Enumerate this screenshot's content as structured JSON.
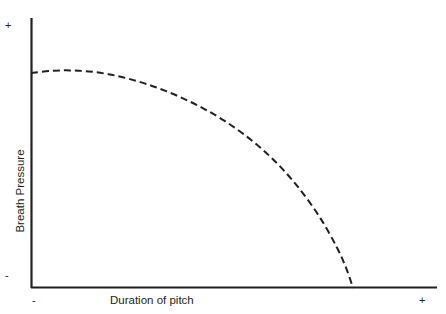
{
  "figure": {
    "background_color": "#ffffff",
    "ink_color": "#231f20",
    "width": 446,
    "height": 314
  },
  "axes": {
    "x": {
      "title": "Duration of pitch",
      "low_tick_label": "-",
      "high_tick_label": "+",
      "line_color": "#231f20",
      "origin_px": 31,
      "end_px": 437,
      "baseline_px": 288
    },
    "y": {
      "title": "Breath Pressure",
      "low_tick_label": "-",
      "high_tick_label": "+",
      "line_color": "#231f20",
      "top_px": 18,
      "bottom_px": 288,
      "axis_px": 31
    }
  },
  "curve": {
    "style": "dashed",
    "color": "#231f20",
    "stroke_width": 2,
    "dash_pattern": "7 4",
    "path": "M 31 73 C 55 70.5, 80 70, 104 71.5 C 132 73.5, 160 82, 186 94 C 212 106.5, 236 121, 262 141 C 288 161.5, 312 187, 332 220 C 343 238, 350 262, 353 288"
  },
  "chart_data": {
    "type": "line",
    "title": "",
    "subtitle": "",
    "xlabel": "Duration of pitch",
    "ylabel": "Breath Pressure",
    "xlim": [
      "-",
      "+"
    ],
    "ylim": [
      "-",
      "+"
    ],
    "xtick_labels": [
      "-",
      "+"
    ],
    "ytick_labels": [
      "-",
      "+"
    ],
    "grid": false,
    "legend": null,
    "annotations": [],
    "series": [
      {
        "name": "Breath pressure over duration of pitch",
        "line_style": "dashed",
        "color": "#231f20",
        "x": [
          0.0,
          0.06,
          0.12,
          0.18,
          0.24,
          0.3,
          0.36,
          0.42,
          0.48,
          0.54,
          0.6,
          0.66,
          0.72,
          0.78,
          0.84,
          0.9,
          0.95,
          0.98,
          1.0
        ],
        "y": [
          0.796,
          0.804,
          0.806,
          0.802,
          0.792,
          0.776,
          0.755,
          0.729,
          0.698,
          0.662,
          0.62,
          0.57,
          0.512,
          0.442,
          0.358,
          0.256,
          0.15,
          0.07,
          0.0
        ]
      }
    ]
  }
}
